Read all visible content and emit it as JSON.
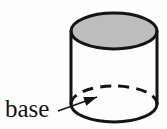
{
  "figure": {
    "kind": "geometry-diagram",
    "background_color": "#fdfdfd",
    "stroke_color": "#141414",
    "fill_color": "#bdbdbd",
    "shading_highlight": "#cfcfcf",
    "label": {
      "text": "base",
      "color": "#141414",
      "x": 5,
      "y": 117
    },
    "leader": {
      "name": "leader-line-to-base",
      "start_x": 58,
      "start_y": 111,
      "end_x": 97,
      "end_y": 97
    },
    "cylinder": {
      "center_x": 114,
      "radius_x": 43,
      "radius_y": 18,
      "top_center_y": 31,
      "bottom_center_y": 104,
      "left_side_x": 71,
      "right_side_x": 157,
      "stroke_width": 3,
      "top_face_label": "top-face",
      "bottom_face_label": "base-face",
      "hidden_edge_style": "dashed",
      "visible_edge_style": "solid"
    }
  }
}
